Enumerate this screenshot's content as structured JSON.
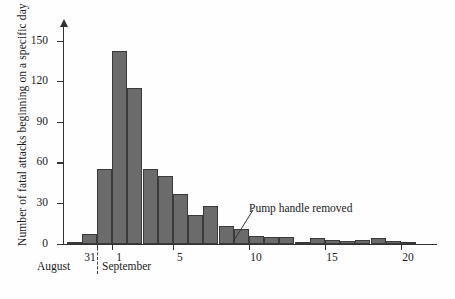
{
  "figure": {
    "ylabel": "Number of fatal attacks beginning on a specific day",
    "annotation": "Pump handle removed",
    "month_left": "August",
    "month_right": "September"
  },
  "chart_data": {
    "type": "bar",
    "title": "",
    "xlabel": "",
    "ylabel": "Number of fatal attacks beginning on a specific day",
    "ylim": [
      0,
      160
    ],
    "yticks": [
      0,
      30,
      60,
      90,
      120,
      150
    ],
    "ytick_labels": [
      "0",
      "30",
      "60",
      "90",
      "120",
      "150"
    ],
    "xlim": [
      29,
      21
    ],
    "xticks": [
      31,
      1,
      5,
      10,
      15,
      20
    ],
    "xtick_labels": [
      "31",
      "1",
      "5",
      "10",
      "15",
      "20"
    ],
    "grid": false,
    "legend": null,
    "annotations": [
      {
        "text": "Pump handle removed",
        "points_to_day": 8
      }
    ],
    "month_divider_after": "31",
    "categories": [
      "Aug 29",
      "Aug 30",
      "Aug 31",
      "Sep 1",
      "Sep 2",
      "Sep 3",
      "Sep 4",
      "Sep 5",
      "Sep 6",
      "Sep 7",
      "Sep 8",
      "Sep 9",
      "Sep 10",
      "Sep 11",
      "Sep 12",
      "Sep 13",
      "Sep 14",
      "Sep 15",
      "Sep 16",
      "Sep 17",
      "Sep 18",
      "Sep 19",
      "Sep 20"
    ],
    "values": [
      1,
      7,
      55,
      142,
      115,
      55,
      50,
      37,
      21,
      28,
      13,
      11,
      6,
      5,
      5,
      1,
      4,
      3,
      2,
      3,
      4,
      2,
      1
    ],
    "bar_color": "#6b6b6b",
    "bar_edge_color": "#3a3a3a"
  }
}
